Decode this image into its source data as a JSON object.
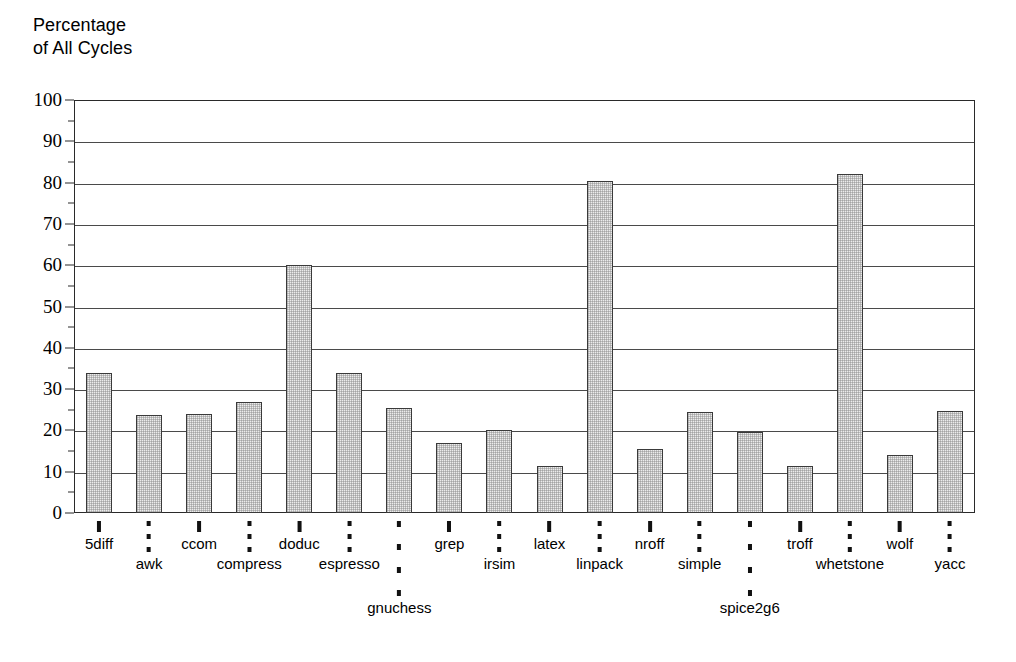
{
  "chart_data": {
    "type": "bar",
    "title": "Percentage\nof All Cycles",
    "xlabel": "",
    "ylabel": "Percentage of All Cycles",
    "ylim": [
      0,
      100
    ],
    "ytick_step": 10,
    "yminor_step": 5,
    "grid": true,
    "legend": null,
    "yticks": [
      "0",
      "10",
      "20",
      "30",
      "40",
      "50",
      "60",
      "70",
      "80",
      "90",
      "100"
    ],
    "categories": [
      "5diff",
      "awk",
      "ccom",
      "compress",
      "doduc",
      "espresso",
      "gnuchess",
      "grep",
      "irsim",
      "latex",
      "linpack",
      "nroff",
      "simple",
      "spice2g6",
      "troff",
      "whetstone",
      "wolf",
      "yacc"
    ],
    "values": [
      34,
      23.8,
      24,
      27,
      60,
      34,
      25.5,
      17,
      20,
      11.5,
      80.5,
      15.5,
      24.5,
      19.5,
      11.5,
      82,
      14,
      24.8
    ],
    "label_rows": [
      1,
      2,
      1,
      2,
      1,
      2,
      3,
      1,
      2,
      1,
      2,
      1,
      2,
      3,
      1,
      2,
      1,
      2
    ],
    "bar_fill": "#ececec",
    "bar_border": "#3a3a3a",
    "grid_color": "#4a4a4a",
    "frame_color": "#2a2a2a",
    "background": "#ffffff"
  }
}
